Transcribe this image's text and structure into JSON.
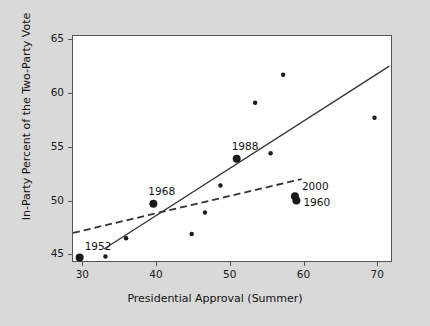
{
  "chart_data": {
    "type": "scatter",
    "title": "",
    "xlabel": "Presidential Approval (Summer)",
    "ylabel": "In-Party Percent of the Two-Party Vote",
    "xlim": [
      28.6,
      72.0
    ],
    "ylim": [
      44.3,
      65.4
    ],
    "xticks": [
      30,
      40,
      50,
      60,
      70
    ],
    "yticks": [
      45,
      50,
      55,
      60,
      65
    ],
    "grid": false,
    "legend": "none",
    "points": [
      {
        "x": 29.5,
        "y": 44.8,
        "label": "1952",
        "highlight": true,
        "label_dx": 6,
        "label_dy": -17
      },
      {
        "x": 33.0,
        "y": 44.9,
        "label": "",
        "highlight": false,
        "label_dx": 0,
        "label_dy": 0
      },
      {
        "x": 35.8,
        "y": 46.6,
        "label": "",
        "highlight": false,
        "label_dx": 0,
        "label_dy": 0
      },
      {
        "x": 39.5,
        "y": 49.8,
        "label": "1968",
        "highlight": true,
        "label_dx": -4,
        "label_dy": -18
      },
      {
        "x": 44.7,
        "y": 47.0,
        "label": "",
        "highlight": false,
        "label_dx": 0,
        "label_dy": 0
      },
      {
        "x": 46.5,
        "y": 49.0,
        "label": "",
        "highlight": false,
        "label_dx": 0,
        "label_dy": 0
      },
      {
        "x": 48.6,
        "y": 51.5,
        "label": "",
        "highlight": false,
        "label_dx": 0,
        "label_dy": 0
      },
      {
        "x": 50.8,
        "y": 54.0,
        "label": "1988",
        "highlight": true,
        "label_dx": -4,
        "label_dy": -18
      },
      {
        "x": 53.3,
        "y": 59.2,
        "label": "",
        "highlight": false,
        "label_dx": 0,
        "label_dy": 0
      },
      {
        "x": 55.4,
        "y": 54.5,
        "label": "",
        "highlight": false,
        "label_dx": 0,
        "label_dy": 0
      },
      {
        "x": 57.1,
        "y": 61.8,
        "label": "",
        "highlight": false,
        "label_dx": 0,
        "label_dy": 0
      },
      {
        "x": 58.7,
        "y": 50.5,
        "label": "2000",
        "highlight": true,
        "label_dx": 8,
        "label_dy": -15
      },
      {
        "x": 58.9,
        "y": 50.1,
        "label": "1960",
        "highlight": true,
        "label_dx": 8,
        "label_dy": -4
      },
      {
        "x": 69.5,
        "y": 57.8,
        "label": "",
        "highlight": false,
        "label_dx": 0,
        "label_dy": 0
      },
      {
        "x": 72.8,
        "y": 61.2,
        "label": "",
        "highlight": false,
        "label_dx": 0,
        "label_dy": 0
      }
    ],
    "lines": [
      {
        "name": "solid-regression-line",
        "style": "solid",
        "x1": 32.8,
        "y1": 45.6,
        "x2": 71.5,
        "y2": 62.6
      },
      {
        "name": "dashed-regression-line",
        "style": "dashed",
        "x1": 28.6,
        "y1": 47.1,
        "x2": 59.6,
        "y2": 52.1
      }
    ]
  },
  "axes": {
    "x_tick_labels": [
      "30",
      "40",
      "50",
      "60",
      "70"
    ],
    "y_tick_labels": [
      "45",
      "50",
      "55",
      "60",
      "65"
    ],
    "x_axis_title": "Presidential Approval (Summer)",
    "y_axis_title": "In-Party Percent of the Two-Party Vote"
  },
  "point_labels": [
    "1952",
    "1968",
    "1988",
    "2000",
    "1960"
  ],
  "colors": {
    "figure_background": "#d9d9d9",
    "plot_background": "#ffffff",
    "axis": "#555555",
    "point": "#1a1a1a",
    "line": "#333333",
    "text": "#111111"
  }
}
